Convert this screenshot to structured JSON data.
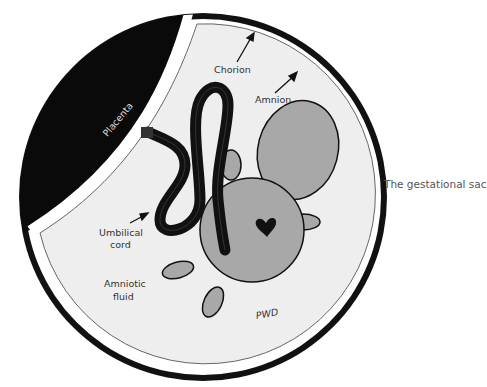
{
  "diagram": {
    "title": "The gestational sac",
    "labels": {
      "placenta": "Placenta",
      "chorion": "Chorion",
      "amnion": "Amnion",
      "umbilical_cord_line1": "Umbilical",
      "umbilical_cord_line2": "cord",
      "amniotic_fluid_line1": "Amniotic",
      "amniotic_fluid_line2": "fluid",
      "signature": "PWD"
    },
    "colors": {
      "placenta": "#0a0a0a",
      "chorion_ring": "#111111",
      "fluid": "#eeeeee",
      "fetus": "#a8a8a8",
      "outline": "#111111"
    }
  }
}
